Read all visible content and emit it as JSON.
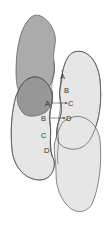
{
  "diagram": {
    "colors": {
      "dark_blob": "#a9a9a9",
      "light_blob": "#e6e6e6",
      "overlap": "#8f8f8f",
      "stroke": "#555555"
    },
    "labels": {
      "right_A": "A",
      "right_B": "B",
      "right_C": "C",
      "right_D": "D",
      "left_A": "A",
      "left_B": "B",
      "left_C": "C",
      "left_D": "D"
    },
    "arrows": [
      {
        "from": "A",
        "to": "C"
      },
      {
        "from": "B",
        "to": "D"
      }
    ]
  }
}
